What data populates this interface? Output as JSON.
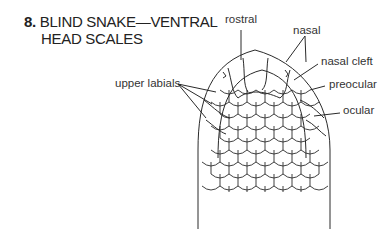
{
  "figure": {
    "number": "8.",
    "title_line1": "BLIND SNAKE—VENTRAL",
    "title_line2": "HEAD SCALES"
  },
  "labels": {
    "rostral": "rostral",
    "nasal": "nasal",
    "nasal_cleft": "nasal cleft",
    "preocular": "preocular",
    "ocular": "ocular",
    "upper_labials": "upper labials"
  },
  "colors": {
    "line": "#2a2a2a",
    "background": "#ffffff"
  }
}
